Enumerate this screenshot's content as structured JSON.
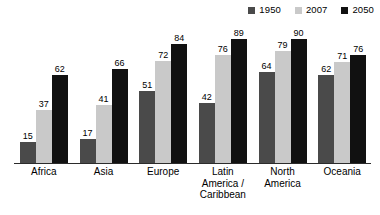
{
  "chart_data": {
    "type": "bar",
    "title": "",
    "subtitle": "",
    "xlabel": "",
    "ylabel": "",
    "ylim": [
      0,
      95
    ],
    "grid": false,
    "legend_position": "top-right",
    "orientation": "vertical",
    "grouping": "grouped",
    "categories": [
      "Africa",
      "Asia",
      "Europe",
      "Latin\nAmerica /\nCaribbean",
      "North\nAmerica",
      "Oceania"
    ],
    "series": [
      {
        "name": "1950",
        "color": "#4a4a4a",
        "values": [
          15,
          17,
          51,
          42,
          64,
          62
        ]
      },
      {
        "name": "2007",
        "color": "#c9c9c9",
        "values": [
          37,
          41,
          72,
          76,
          79,
          71
        ]
      },
      {
        "name": "2050",
        "color": "#111111",
        "values": [
          62,
          66,
          84,
          89,
          90,
          76
        ]
      }
    ],
    "axis_line_color": "#2b2b2b",
    "background": "#ffffff",
    "value_labels": true
  }
}
